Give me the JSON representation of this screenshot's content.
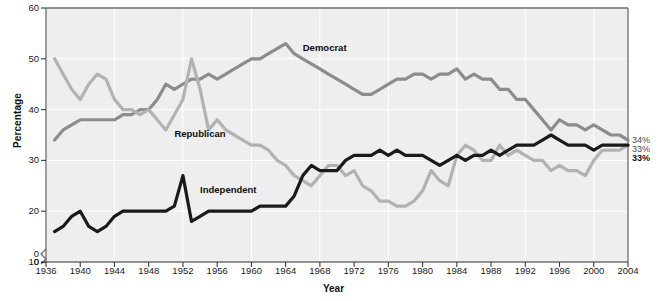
{
  "chart_data": {
    "type": "line",
    "title": "",
    "xlabel": "Year",
    "ylabel": "Percentage",
    "xlim": [
      1936,
      2004
    ],
    "ylim": [
      0,
      60
    ],
    "y_axis_break": true,
    "grid": true,
    "legend_position": "inline-annotations",
    "yticks": [
      "0",
      "0",
      "10",
      "20",
      "30",
      "40",
      "50",
      "60"
    ],
    "ytick_values": [
      0,
      10,
      20,
      30,
      40,
      50,
      60
    ],
    "xticks": [
      "1936",
      "1940",
      "1944",
      "1948",
      "1952",
      "1956",
      "1960",
      "1964",
      "1968",
      "1972",
      "1976",
      "1980",
      "1984",
      "1988",
      "1992",
      "1996",
      "2000",
      "2004"
    ],
    "annotations": [
      {
        "text": "Democrat",
        "x": 1966,
        "y": 52
      },
      {
        "text": "Republican",
        "x": 1951,
        "y": 35
      },
      {
        "text": "Independent",
        "x": 1954,
        "y": 24
      }
    ],
    "end_labels": [
      {
        "text": "34%",
        "series": "Democrat",
        "value": 34,
        "color": "#8c8c8c"
      },
      {
        "text": "33%",
        "series": "Republican",
        "value": 33,
        "color": "#b2b2b2"
      },
      {
        "text": "33%",
        "series": "Independent",
        "value": 33,
        "color": "#111111"
      }
    ],
    "series": [
      {
        "name": "Democrat",
        "color": "#8c8c8c",
        "x": [
          1937,
          1938,
          1939,
          1940,
          1941,
          1942,
          1943,
          1944,
          1945,
          1946,
          1947,
          1948,
          1949,
          1950,
          1951,
          1952,
          1953,
          1954,
          1955,
          1956,
          1957,
          1958,
          1959,
          1960,
          1961,
          1962,
          1963,
          1964,
          1965,
          1966,
          1967,
          1968,
          1969,
          1970,
          1971,
          1972,
          1973,
          1974,
          1975,
          1976,
          1977,
          1978,
          1979,
          1980,
          1981,
          1982,
          1983,
          1984,
          1985,
          1986,
          1987,
          1988,
          1989,
          1990,
          1991,
          1992,
          1993,
          1994,
          1995,
          1996,
          1997,
          1998,
          1999,
          2000,
          2001,
          2002,
          2003,
          2004
        ],
        "values": [
          34,
          36,
          37,
          38,
          38,
          38,
          38,
          38,
          39,
          39,
          40,
          40,
          42,
          45,
          44,
          45,
          46,
          46,
          47,
          46,
          47,
          48,
          49,
          50,
          50,
          51,
          52,
          53,
          51,
          50,
          49,
          48,
          47,
          46,
          45,
          44,
          43,
          43,
          44,
          45,
          46,
          46,
          47,
          47,
          46,
          47,
          47,
          48,
          46,
          47,
          46,
          46,
          44,
          44,
          42,
          42,
          40,
          38,
          36,
          38,
          37,
          37,
          36,
          37,
          36,
          35,
          35,
          34
        ]
      },
      {
        "name": "Republican",
        "color": "#b2b2b2",
        "x": [
          1937,
          1938,
          1939,
          1940,
          1941,
          1942,
          1943,
          1944,
          1945,
          1946,
          1947,
          1948,
          1949,
          1950,
          1951,
          1952,
          1953,
          1954,
          1955,
          1956,
          1957,
          1958,
          1959,
          1960,
          1961,
          1962,
          1963,
          1964,
          1965,
          1966,
          1967,
          1968,
          1969,
          1970,
          1971,
          1972,
          1973,
          1974,
          1975,
          1976,
          1977,
          1978,
          1979,
          1980,
          1981,
          1982,
          1983,
          1984,
          1985,
          1986,
          1987,
          1988,
          1989,
          1990,
          1991,
          1992,
          1993,
          1994,
          1995,
          1996,
          1997,
          1998,
          1999,
          2000,
          2001,
          2002,
          2003,
          2004
        ],
        "values": [
          50,
          47,
          44,
          42,
          45,
          47,
          46,
          42,
          40,
          40,
          39,
          40,
          38,
          36,
          39,
          42,
          50,
          44,
          36,
          38,
          36,
          35,
          34,
          33,
          33,
          32,
          30,
          29,
          27,
          26,
          25,
          27,
          29,
          29,
          27,
          28,
          25,
          24,
          22,
          22,
          21,
          21,
          22,
          24,
          28,
          26,
          25,
          31,
          33,
          32,
          30,
          30,
          33,
          31,
          32,
          31,
          30,
          30,
          28,
          29,
          28,
          28,
          27,
          30,
          32,
          32,
          32,
          33
        ]
      },
      {
        "name": "Independent",
        "color": "#1a1a1a",
        "x": [
          1937,
          1938,
          1939,
          1940,
          1941,
          1942,
          1943,
          1944,
          1945,
          1946,
          1947,
          1948,
          1949,
          1950,
          1951,
          1952,
          1953,
          1954,
          1955,
          1956,
          1957,
          1958,
          1959,
          1960,
          1961,
          1962,
          1963,
          1964,
          1965,
          1966,
          1967,
          1968,
          1969,
          1970,
          1971,
          1972,
          1973,
          1974,
          1975,
          1976,
          1977,
          1978,
          1979,
          1980,
          1981,
          1982,
          1983,
          1984,
          1985,
          1986,
          1987,
          1988,
          1989,
          1990,
          1991,
          1992,
          1993,
          1994,
          1995,
          1996,
          1997,
          1998,
          1999,
          2000,
          2001,
          2002,
          2003,
          2004
        ],
        "values": [
          16,
          17,
          19,
          20,
          17,
          16,
          17,
          19,
          20,
          20,
          20,
          20,
          20,
          20,
          21,
          27,
          18,
          19,
          20,
          20,
          20,
          20,
          20,
          20,
          21,
          21,
          21,
          21,
          23,
          27,
          29,
          28,
          28,
          28,
          30,
          31,
          31,
          31,
          32,
          31,
          32,
          31,
          31,
          31,
          30,
          29,
          30,
          31,
          30,
          31,
          31,
          32,
          31,
          32,
          33,
          33,
          33,
          34,
          35,
          34,
          33,
          33,
          33,
          32,
          33,
          33,
          33,
          33
        ]
      }
    ]
  }
}
